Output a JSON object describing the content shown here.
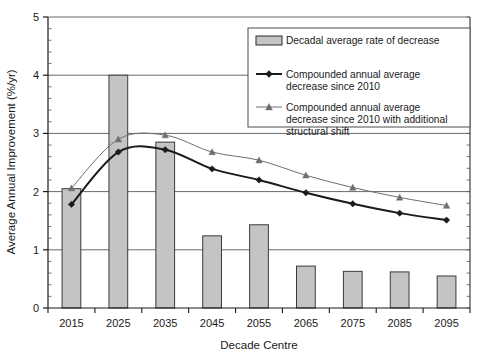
{
  "chart_data": {
    "type": "bar",
    "title": "",
    "subtitle": "",
    "xlabel": "Decade Centre",
    "ylabel": "Average Annual Improvement (%/yr)",
    "categories": [
      "2015",
      "2025",
      "2035",
      "2045",
      "2055",
      "2065",
      "2075",
      "2085",
      "2095"
    ],
    "ylim": [
      0,
      5
    ],
    "yticks": [
      0,
      1,
      2,
      3,
      4,
      5
    ],
    "ytick_labels": [
      "0",
      "1",
      "2",
      "3",
      "4",
      "5"
    ],
    "y_minor_tick_interval": 0.2,
    "grid": "horizontal",
    "legend_position": "top-right",
    "series": [
      {
        "name": "Decadal average rate of decrease",
        "type": "bar",
        "values": [
          2.05,
          4.0,
          2.85,
          1.24,
          1.43,
          0.72,
          0.63,
          0.62,
          0.55
        ],
        "fill_color": "#C4C4C4",
        "edge_color": "#3a3a3a"
      },
      {
        "name": "Compounded annual average decrease since 2010",
        "type": "line",
        "values": [
          1.78,
          2.68,
          2.72,
          2.39,
          2.2,
          1.98,
          1.79,
          1.63,
          1.51
        ],
        "line_color": "#1a1a1a",
        "line_width": 2.0,
        "marker": "diamond"
      },
      {
        "name": "Compounded annual average decrease since 2010 with additional structural shift",
        "type": "line",
        "values": [
          2.06,
          2.9,
          2.97,
          2.68,
          2.54,
          2.28,
          2.07,
          1.9,
          1.76
        ],
        "line_color": "#6e6e6e",
        "line_width": 1.0,
        "marker": "triangle"
      }
    ]
  },
  "legend": {
    "entries": [
      {
        "label": "Decadal average rate of decrease",
        "marker": "swatch"
      },
      {
        "label_line1": "Compounded annual average",
        "label_line2": "decrease since 2010",
        "marker": "diamond"
      },
      {
        "label_line1": "Compounded annual average",
        "label_line2": "decrease since 2010 with additional",
        "label_line3": "structural shift",
        "marker": "triangle"
      }
    ]
  },
  "colors": {
    "bar_fill": "#C4C4C4",
    "bar_edge": "#3a3a3a",
    "axis": "#1a1a1a",
    "grid": "#6a6a6a",
    "series1_line": "#1a1a1a",
    "series2_line": "#6e6e6e",
    "background": "#ffffff"
  }
}
